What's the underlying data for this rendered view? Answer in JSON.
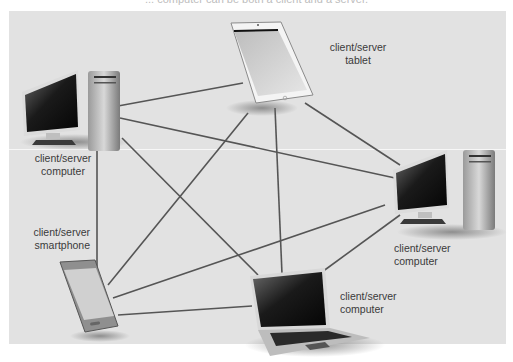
{
  "caption": "... computer can be both a client and a server.",
  "diagram": {
    "nodes": [
      {
        "id": "tl-computer",
        "type": "desktop computer",
        "label_line1": "client/server",
        "label_line2": "computer"
      },
      {
        "id": "tablet",
        "type": "tablet",
        "label_line1": "client/server",
        "label_line2": "tablet"
      },
      {
        "id": "right-computer",
        "type": "desktop computer",
        "label_line1": "client/server",
        "label_line2": "computer"
      },
      {
        "id": "smartphone",
        "type": "smartphone",
        "label_line1": "client/server",
        "label_line2": "smartphone"
      },
      {
        "id": "laptop",
        "type": "laptop computer",
        "label_line1": "client/server",
        "label_line2": "computer"
      }
    ],
    "edges": [
      [
        "tl-computer",
        "tablet"
      ],
      [
        "tl-computer",
        "right-computer"
      ],
      [
        "tl-computer",
        "laptop"
      ],
      [
        "tl-computer",
        "smartphone"
      ],
      [
        "tablet",
        "smartphone"
      ],
      [
        "tablet",
        "laptop"
      ],
      [
        "tablet",
        "right-computer"
      ],
      [
        "right-computer",
        "smartphone"
      ],
      [
        "right-computer",
        "laptop"
      ],
      [
        "smartphone",
        "laptop"
      ]
    ],
    "colors": {
      "panel": "#e2e2e2",
      "edge": "#555555",
      "label": "#3a3a3a"
    }
  }
}
